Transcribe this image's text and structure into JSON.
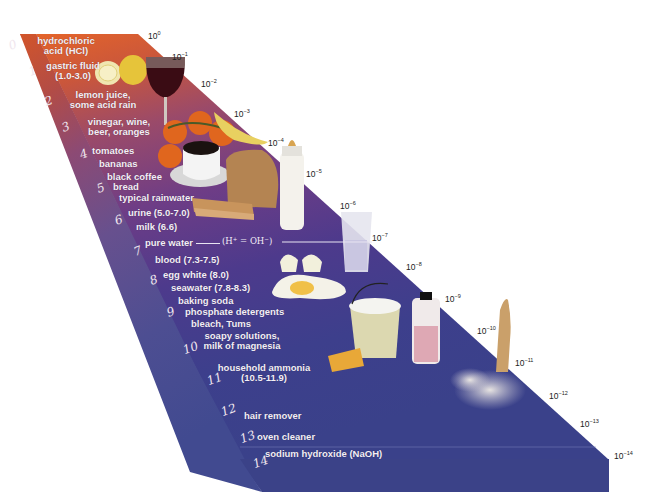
{
  "diagram": {
    "type": "3D slab scale, acidic (orange) to basic (blue)",
    "colors": {
      "acid_top": "#e0622a",
      "mid": "#6e3e86",
      "base_bottom": "#3a3f8a",
      "side_face": "#584a8e",
      "front_face": "#3b4187",
      "label_text": "#f3eef6",
      "exponent_text": "#222222"
    },
    "ph_numbers": [
      "0",
      "1",
      "2",
      "3",
      "4",
      "5",
      "6",
      "7",
      "8",
      "9",
      "10",
      "11",
      "12",
      "13",
      "14"
    ],
    "h_concentration": [
      {
        "base": "10",
        "exp": "0"
      },
      {
        "base": "10",
        "exp": "−1"
      },
      {
        "base": "10",
        "exp": "−2"
      },
      {
        "base": "10",
        "exp": "−3"
      },
      {
        "base": "10",
        "exp": "−4"
      },
      {
        "base": "10",
        "exp": "−5"
      },
      {
        "base": "10",
        "exp": "−6"
      },
      {
        "base": "10",
        "exp": "−7"
      },
      {
        "base": "10",
        "exp": "−8"
      },
      {
        "base": "10",
        "exp": "−9"
      },
      {
        "base": "10",
        "exp": "−10"
      },
      {
        "base": "10",
        "exp": "−11"
      },
      {
        "base": "10",
        "exp": "−12"
      },
      {
        "base": "10",
        "exp": "−13"
      },
      {
        "base": "10",
        "exp": "−14"
      }
    ],
    "substances": [
      {
        "line1": "hydrochloric",
        "line2": "acid (HCl)"
      },
      {
        "line1": "gastric fluid",
        "line2": "(1.0-3.0)"
      },
      {
        "line1": "lemon juice,",
        "line2": "some acid rain"
      },
      {
        "line1": "vinegar, wine,",
        "line2": "beer, oranges"
      },
      {
        "line1": "tomatoes"
      },
      {
        "line1": "bananas"
      },
      {
        "line1": "black coffee",
        "line2": "bread"
      },
      {
        "line1": "typical rainwater"
      },
      {
        "line1": "urine (5.0-7.0)"
      },
      {
        "line1": "milk (6.6)"
      },
      {
        "line1": "pure water"
      },
      {
        "line1": "blood (7.3-7.5)"
      },
      {
        "line1": "egg white (8.0)"
      },
      {
        "line1": "seawater (7.8-8.3)"
      },
      {
        "line1": "baking soda"
      },
      {
        "line1": "phosphate detergents"
      },
      {
        "line1": "bleach, Tums"
      },
      {
        "line1": "soapy solutions,",
        "line2": "milk of magnesia"
      },
      {
        "line1": "household ammonia",
        "line2": "(10.5-11.9)"
      },
      {
        "line1": "hair remover"
      },
      {
        "line1": "oven cleaner"
      },
      {
        "line1": "sodium hydroxide (NaOH)"
      }
    ],
    "pure_water_formula": {
      "h": "H",
      "h_sup": "+",
      "eq": " = ",
      "oh": "OH",
      "oh_sup": "−"
    },
    "illustrations": [
      "lemon",
      "wine-glass",
      "tomatoes",
      "bananas",
      "coffee-cup",
      "bread",
      "baby-bottle",
      "water-glass",
      "egg",
      "bucket",
      "sponge",
      "bleach-bottle",
      "leg-with-hair-remover"
    ]
  }
}
